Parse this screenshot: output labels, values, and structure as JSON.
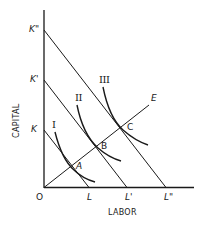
{
  "diagram": {
    "type": "isoquant-expansion-path",
    "axes": {
      "x_label": "LABOR",
      "y_label": "CAPITAL",
      "origin_label": "O"
    },
    "y_intercepts": [
      "K",
      "K'",
      "K\""
    ],
    "x_intercepts": [
      "L",
      "L'",
      "L\""
    ],
    "isoquants": [
      "I",
      "II",
      "III"
    ],
    "tangency_points": [
      "A",
      "B",
      "C"
    ],
    "expansion_path_label": "E",
    "colors": {
      "line": "#1a1a1a",
      "background": "#ffffff"
    }
  }
}
